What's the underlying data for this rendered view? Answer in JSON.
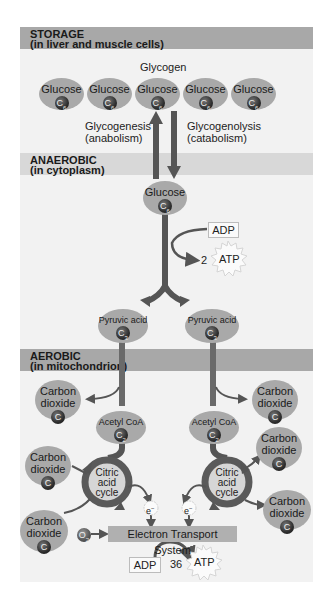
{
  "sections": {
    "storage": {
      "title": "STORAGE",
      "subtitle": "(in liver and muscle cells)"
    },
    "anaerobic": {
      "title": "ANAEROBIC",
      "subtitle": "(in cytoplasm)"
    },
    "aerobic": {
      "title": "AEROBIC",
      "subtitle": "(in mitochondrion)"
    }
  },
  "storage": {
    "glycogen_label": "Glycogen",
    "glucose_chain": [
      {
        "name": "Glucose",
        "carbon": "C",
        "count": "6"
      },
      {
        "name": "Glucose",
        "carbon": "C",
        "count": "6"
      },
      {
        "name": "Glucose",
        "carbon": "C",
        "count": "6"
      },
      {
        "name": "Glucose",
        "carbon": "C",
        "count": "6"
      },
      {
        "name": "Glucose",
        "carbon": "C",
        "count": "6"
      }
    ],
    "glycogenesis": {
      "line1": "Glycogenesis",
      "line2": "(anabolism)"
    },
    "glycogenolysis": {
      "line1": "Glycogenolysis",
      "line2": "(catabolism)"
    }
  },
  "anaerobic": {
    "glucose": {
      "name": "Glucose",
      "carbon": "C",
      "count": "6"
    },
    "adp_label": "ADP",
    "atp_count": "2",
    "atp_label": "ATP",
    "pyruvic_left": {
      "name": "Pyruvic acid",
      "carbon": "C",
      "count": "3"
    },
    "pyruvic_right": {
      "name": "Pyruvic acid",
      "carbon": "C",
      "count": "3"
    }
  },
  "aerobic": {
    "co2_top_left": {
      "line1": "Carbon",
      "line2": "dioxide",
      "carbon": "C"
    },
    "co2_top_right": {
      "line1": "Carbon",
      "line2": "dioxide",
      "carbon": "C"
    },
    "acetyl_left": {
      "name": "Acetyl CoA",
      "carbon": "C",
      "count": "2"
    },
    "acetyl_right": {
      "name": "Acetyl CoA",
      "carbon": "C",
      "count": "2"
    },
    "co2_mid_left": {
      "line1": "Carbon",
      "line2": "dioxide",
      "carbon": "C"
    },
    "co2_mid_right": {
      "line1": "Carbon",
      "line2": "dioxide",
      "carbon": "C"
    },
    "co2_bottom_left": {
      "line1": "Carbon",
      "line2": "dioxide",
      "carbon": "C"
    },
    "co2_bottom_right": {
      "line1": "Carbon",
      "line2": "dioxide",
      "carbon": "C"
    },
    "cycle_left": {
      "line1": "Citric",
      "line2": "acid",
      "line3": "cycle"
    },
    "cycle_right": {
      "line1": "Citric",
      "line2": "acid",
      "line3": "cycle"
    },
    "electron_label": "e",
    "electron_charge": "−",
    "oxygen": {
      "symbol": "O",
      "count": "2"
    },
    "ets_label": "Electron Transport System",
    "adp_label": "ADP",
    "atp_count": "36",
    "atp_label": "ATP"
  },
  "colors": {
    "panel_bg": "#f2f2f2",
    "band_dark": "#a8a8a8",
    "band_light": "#d8d8d8",
    "oval_fill": "#a9a9a9",
    "arrow": "#555555",
    "carbon_ball": "#2e2e2e"
  }
}
